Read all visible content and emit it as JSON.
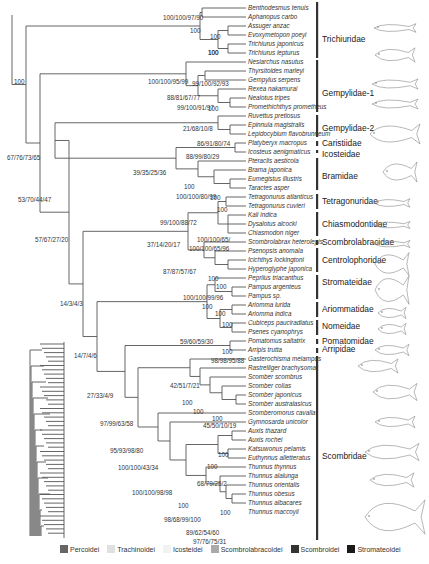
{
  "figure": {
    "root_support": "100",
    "taxa": [
      {
        "name": "Benthodesmus tenuis",
        "y": 8
      },
      {
        "name": "Aphanopus carbo",
        "y": 17
      },
      {
        "name": "Assuger anzac",
        "y": 26
      },
      {
        "name": "Evoxymetopon poeyi",
        "y": 35
      },
      {
        "name": "Trichiurus japonicus",
        "y": 44
      },
      {
        "name": "Trichiurus lepturus",
        "y": 53
      },
      {
        "name": "Nesiarchus nasutus",
        "y": 62
      },
      {
        "name": "Thyrsitoides marleyi",
        "y": 71
      },
      {
        "name": "Gempylus serpens",
        "y": 80
      },
      {
        "name": "Rexea nakamurai",
        "y": 89
      },
      {
        "name": "Nealotus tripes",
        "y": 98
      },
      {
        "name": "Promethichthys prometheus",
        "y": 107
      },
      {
        "name": "Ruvettus pretiosus",
        "y": 116
      },
      {
        "name": "Epinnula magistralis",
        "y": 125
      },
      {
        "name": "Lepidocybium flavobrunneum",
        "y": 134
      },
      {
        "name": "Platyberyx macropus",
        "y": 143
      },
      {
        "name": "Icosteus aenigmaticus",
        "y": 152
      },
      {
        "name": "Pteraclis aesticola",
        "y": 161
      },
      {
        "name": "Brama japonica",
        "y": 170
      },
      {
        "name": "Eumegistus illustris",
        "y": 179
      },
      {
        "name": "Taractes asper",
        "y": 188
      },
      {
        "name": "Tetragonurus atlanticus",
        "y": 197
      },
      {
        "name": "Tetragonurus cuvieri",
        "y": 206
      },
      {
        "name": "Kali indica",
        "y": 215
      },
      {
        "name": "Dysalotus alcocki",
        "y": 224
      },
      {
        "name": "Chiasmodon niger",
        "y": 233
      },
      {
        "name": "Scombrolabrax heterolepis",
        "y": 242
      },
      {
        "name": "Psenopsis anomala",
        "y": 251
      },
      {
        "name": "Icichthys lockingtoni",
        "y": 260
      },
      {
        "name": "Hyperoglyphe japonica",
        "y": 269
      },
      {
        "name": "Peprilus triacanthus",
        "y": 278
      },
      {
        "name": "Pampus argenteus",
        "y": 287
      },
      {
        "name": "Pampus sp.",
        "y": 296
      },
      {
        "name": "Ariomma lurida",
        "y": 305
      },
      {
        "name": "Ariomma indica",
        "y": 314
      },
      {
        "name": "Cubiceps pauciradiatus",
        "y": 323
      },
      {
        "name": "Psenes cyanophrys",
        "y": 332
      },
      {
        "name": "Pomatomus saltatrix",
        "y": 341
      },
      {
        "name": "Arripis trutta",
        "y": 350
      },
      {
        "name": "Gasterochisma melampus",
        "y": 359
      },
      {
        "name": "Rastrelliger brachysoma",
        "y": 368
      },
      {
        "name": "Scomber scombrus",
        "y": 377
      },
      {
        "name": "Scomber colias",
        "y": 386
      },
      {
        "name": "Scomber japonicus",
        "y": 395
      },
      {
        "name": "Scomber australasicus",
        "y": 404
      },
      {
        "name": "Scomberomorus cavalla",
        "y": 413
      },
      {
        "name": "Gymnosarda unicolor",
        "y": 422
      },
      {
        "name": "Auxis thazard",
        "y": 431
      },
      {
        "name": "Auxis rochei",
        "y": 440
      },
      {
        "name": "Katsuwonus pelamis",
        "y": 449
      },
      {
        "name": "Euthynnus alletteratus",
        "y": 458
      },
      {
        "name": "Thunnus thynnus",
        "y": 467
      },
      {
        "name": "Thunnus alalunga",
        "y": 476
      },
      {
        "name": "Thunnus orientalis",
        "y": 485
      },
      {
        "name": "Thunnus obesus",
        "y": 494
      },
      {
        "name": "Thunnus albacares",
        "y": 503
      },
      {
        "name": "Thunnus maccoyii",
        "y": 512
      }
    ],
    "support_labels": [
      {
        "text": "100/100/97/90",
        "x": 163,
        "y": 20
      },
      {
        "text": "100",
        "x": 190,
        "y": 33
      },
      {
        "text": "100",
        "x": 208,
        "y": 55
      },
      {
        "text": "100",
        "x": 210,
        "y": 39
      },
      {
        "text": "100",
        "x": 208,
        "y": 55
      },
      {
        "text": "100/100/95/99",
        "x": 148,
        "y": 84
      },
      {
        "text": "99/100/92/93",
        "x": 192,
        "y": 86
      },
      {
        "text": "88/81/67/77",
        "x": 167,
        "y": 100
      },
      {
        "text": "99/100/91/97",
        "x": 177,
        "y": 110
      },
      {
        "text": "100",
        "x": 208,
        "y": 111
      },
      {
        "text": "21/68/10/8",
        "x": 183,
        "y": 131
      },
      {
        "text": "86/91/80/74",
        "x": 197,
        "y": 146
      },
      {
        "text": "88/99/80/29",
        "x": 186,
        "y": 159
      },
      {
        "text": "39/35/25/36",
        "x": 133,
        "y": 175
      },
      {
        "text": "100",
        "x": 184,
        "y": 189
      },
      {
        "text": "100/100/80/99",
        "x": 176,
        "y": 199
      },
      {
        "text": "100",
        "x": 210,
        "y": 200
      },
      {
        "text": "100",
        "x": 217,
        "y": 212
      },
      {
        "text": "99/100/88/72",
        "x": 160,
        "y": 225
      },
      {
        "text": "37/14/20/17",
        "x": 147,
        "y": 247
      },
      {
        "text": "100/100/65/",
        "x": 197,
        "y": 242
      },
      {
        "text": "100/100/65/96",
        "x": 189,
        "y": 251
      },
      {
        "text": "87/87/57/67",
        "x": 163,
        "y": 274
      },
      {
        "text": "100",
        "x": 208,
        "y": 281
      },
      {
        "text": "100",
        "x": 216,
        "y": 289
      },
      {
        "text": "100/100/99/96",
        "x": 183,
        "y": 300
      },
      {
        "text": "100",
        "x": 202,
        "y": 309
      },
      {
        "text": "100",
        "x": 215,
        "y": 316
      },
      {
        "text": "100",
        "x": 222,
        "y": 327
      },
      {
        "text": "59/60/59/30",
        "x": 180,
        "y": 344
      },
      {
        "text": "100",
        "x": 222,
        "y": 354
      },
      {
        "text": "98/98/95/88",
        "x": 211,
        "y": 363
      },
      {
        "text": "42/51/7/21",
        "x": 170,
        "y": 388
      },
      {
        "text": "100",
        "x": 182,
        "y": 405
      },
      {
        "text": "100",
        "x": 193,
        "y": 414
      },
      {
        "text": "100",
        "x": 212,
        "y": 421
      },
      {
        "text": "45/50/10/19",
        "x": 203,
        "y": 428
      },
      {
        "text": "95/93/98/80",
        "x": 110,
        "y": 453
      },
      {
        "text": "100",
        "x": 218,
        "y": 457
      },
      {
        "text": "100/100/43/34",
        "x": 118,
        "y": 470
      },
      {
        "text": "100",
        "x": 207,
        "y": 469
      },
      {
        "text": "68/79/25/2",
        "x": 197,
        "y": 486
      },
      {
        "text": "100/100/98/98",
        "x": 132,
        "y": 495
      },
      {
        "text": "100",
        "x": 178,
        "y": 508
      },
      {
        "text": "100",
        "x": 220,
        "y": 515
      },
      {
        "text": "98/68/99/100",
        "x": 164,
        "y": 522
      },
      {
        "text": "89/62/54/60",
        "x": 186,
        "y": 535
      },
      {
        "text": "97/76/75/31",
        "x": 193,
        "y": 544
      },
      {
        "text": "67/76/73/65",
        "x": 7,
        "y": 160
      },
      {
        "text": "53/70/44/47",
        "x": 18,
        "y": 202
      },
      {
        "text": "57/67/27/20",
        "x": 35,
        "y": 242
      },
      {
        "text": "14/3/4/3",
        "x": 60,
        "y": 306
      },
      {
        "text": "14/7/4/6",
        "x": 74,
        "y": 358
      },
      {
        "text": "27/33/4/9",
        "x": 87,
        "y": 398
      },
      {
        "text": "97/99/63/58",
        "x": 100,
        "y": 426
      }
    ],
    "families": [
      {
        "name": "Trichiuridae",
        "y1": 2,
        "y2": 58,
        "label_y": 42
      },
      {
        "name": "Gempylidae-1",
        "y1": 60,
        "y2": 112,
        "label_y": 96
      },
      {
        "name": "Gempylidae-2",
        "y1": 115,
        "y2": 137,
        "label_y": 131
      },
      {
        "name": "Caristiidae",
        "y1": 141,
        "y2": 146,
        "label_y": 146
      },
      {
        "name": "Icosteidae",
        "y1": 150,
        "y2": 150,
        "label_y": 157
      },
      {
        "name": "Bramidae",
        "y1": 158,
        "y2": 190,
        "label_y": 179
      },
      {
        "name": "Tetragonuridae",
        "y1": 194,
        "y2": 209,
        "label_y": 204
      },
      {
        "name": "Chiasmodontidae",
        "y1": 212,
        "y2": 236,
        "label_y": 227
      },
      {
        "name": "Scombrolabracidae",
        "y1": 240,
        "y2": 245,
        "label_y": 245
      },
      {
        "name": "Centrolophoridae",
        "y1": 248,
        "y2": 272,
        "label_y": 263
      },
      {
        "name": "Stromateidae",
        "y1": 275,
        "y2": 299,
        "label_y": 285
      },
      {
        "name": "Ariommatidae",
        "y1": 302,
        "y2": 317,
        "label_y": 312
      },
      {
        "name": "Nomeidae",
        "y1": 320,
        "y2": 335,
        "label_y": 329
      },
      {
        "name": "Pomatomidae",
        "y1": 339,
        "y2": 344,
        "label_y": 344
      },
      {
        "name": "Arripidae",
        "y1": 348,
        "y2": 353,
        "label_y": 352
      },
      {
        "name": "Scombridae",
        "y1": 356,
        "y2": 540,
        "label_y": 459
      }
    ],
    "legend": [
      {
        "label": "Percoidei",
        "color": "#666666"
      },
      {
        "label": "Trachinoidei",
        "color": "#e0e0e0"
      },
      {
        "label": "Icosteidei",
        "color": "#f2f2f2"
      },
      {
        "label": "Scombrolabracoidei",
        "color": "#aaaaaa"
      },
      {
        "label": "Scombroidei",
        "color": "#333333"
      },
      {
        "label": "Stromateoidei",
        "color": "#1a1a1a"
      }
    ]
  }
}
